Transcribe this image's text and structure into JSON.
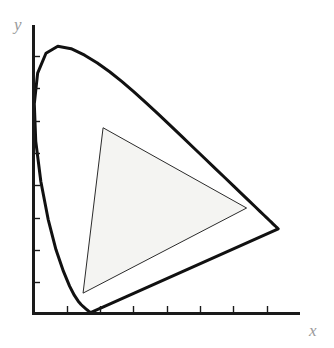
{
  "figure": {
    "kind": "cie-chromaticity-diagram",
    "background_color": "#ffffff",
    "axes": {
      "x_label": "x",
      "y_label": "y",
      "label_color": "#9a9a9a",
      "axis_color": "#1a1a1a",
      "origin_px": [
        33,
        314
      ],
      "x_axis_end_px": [
        300,
        314
      ],
      "y_axis_top_px": [
        33,
        25
      ],
      "x_ticks_px": [
        67,
        100,
        133,
        167,
        200,
        233,
        267
      ],
      "y_ticks_px": [
        56,
        88,
        121,
        153,
        185,
        218,
        250,
        282
      ],
      "tick_length_px": 5
    },
    "spectral_locus": {
      "name": "spectral-locus",
      "stroke_color": "#111111",
      "stroke_width": 3,
      "fill": "none",
      "description": "CIE 1931 horseshoe-shaped spectral locus closed by the line of purples"
    },
    "gamut_triangle": {
      "name": "gamut-triangle",
      "stroke_color": "#2b2b2b",
      "stroke_width": 1,
      "fill_color": "#f4f4f2",
      "vertices_px": [
        [
          136,
          122
        ],
        [
          255,
          212
        ],
        [
          88,
          293
        ]
      ],
      "vertex_names": [
        "green-primary",
        "red-primary",
        "blue-primary"
      ]
    }
  },
  "chart_data": {
    "type": "line",
    "title": "",
    "xlabel": "x",
    "ylabel": "y",
    "xlim": [
      0,
      0.8
    ],
    "ylim": [
      0,
      0.9
    ],
    "grid": false,
    "legend": "none",
    "series": [
      {
        "name": "spectral locus",
        "closed": true,
        "x": [
          0.1741,
          0.174,
          0.1738,
          0.1736,
          0.1733,
          0.173,
          0.1726,
          0.1721,
          0.1714,
          0.1703,
          0.1689,
          0.1669,
          0.1644,
          0.1611,
          0.1566,
          0.151,
          0.144,
          0.1355,
          0.1241,
          0.1096,
          0.0913,
          0.0687,
          0.0454,
          0.0235,
          0.0082,
          0.0039,
          0.0139,
          0.0389,
          0.0743,
          0.1142,
          0.1547,
          0.1929,
          0.2296,
          0.2658,
          0.3016,
          0.3373,
          0.3731,
          0.4087,
          0.4441,
          0.4788,
          0.5125,
          0.5448,
          0.5752,
          0.6029,
          0.627,
          0.6482,
          0.6658,
          0.6801,
          0.6915,
          0.7006,
          0.7079,
          0.714,
          0.719,
          0.723,
          0.726,
          0.7283,
          0.73,
          0.7311,
          0.732,
          0.7327,
          0.7334,
          0.734,
          0.7344,
          0.7346,
          0.7347,
          0.1741
        ],
        "y": [
          0.005,
          0.005,
          0.0049,
          0.0049,
          0.0048,
          0.0048,
          0.0048,
          0.0048,
          0.0051,
          0.0058,
          0.0069,
          0.0086,
          0.0109,
          0.0138,
          0.0177,
          0.0227,
          0.0297,
          0.0399,
          0.0578,
          0.0868,
          0.1327,
          0.2007,
          0.295,
          0.4127,
          0.5384,
          0.6548,
          0.7502,
          0.812,
          0.8338,
          0.8262,
          0.8059,
          0.7816,
          0.7543,
          0.7243,
          0.6923,
          0.6589,
          0.6245,
          0.5896,
          0.5547,
          0.5202,
          0.4866,
          0.4544,
          0.4242,
          0.3965,
          0.3725,
          0.3514,
          0.334,
          0.3197,
          0.3083,
          0.2993,
          0.292,
          0.2859,
          0.2809,
          0.277,
          0.274,
          0.2717,
          0.27,
          0.2689,
          0.268,
          0.2673,
          0.2666,
          0.266,
          0.2656,
          0.2654,
          0.2653,
          0.005
        ]
      },
      {
        "name": "gamut triangle",
        "closed": true,
        "x": [
          0.21,
          0.64,
          0.15,
          0.21
        ],
        "y": [
          0.58,
          0.33,
          0.065,
          0.58
        ]
      }
    ]
  }
}
